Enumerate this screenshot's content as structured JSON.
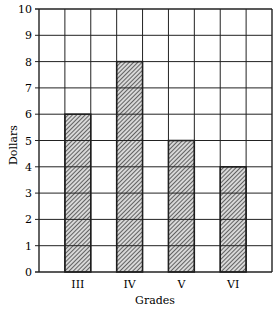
{
  "chart_data": {
    "type": "bar",
    "title": "",
    "xlabel": "Grades",
    "ylabel": "Dollars",
    "categories": [
      "III",
      "IV",
      "V",
      "VI"
    ],
    "values": [
      6,
      8,
      5,
      4
    ],
    "ylim": [
      0,
      10
    ],
    "yticks": [
      "0",
      "1",
      "2",
      "3",
      "4",
      "5",
      "6",
      "7",
      "8",
      "9",
      "10"
    ],
    "grid": true,
    "bar_fill": "hatched",
    "legend": null
  }
}
